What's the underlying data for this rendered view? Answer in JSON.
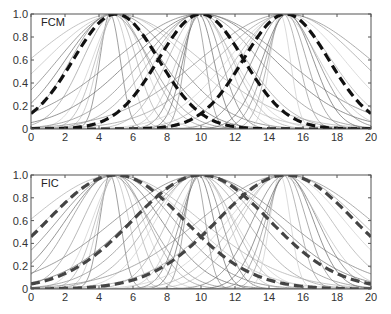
{
  "chart_data": [
    {
      "type": "line",
      "title": "FCM",
      "xlabel": "",
      "ylabel": "",
      "xlim": [
        0,
        20
      ],
      "ylim": [
        0,
        1.0
      ],
      "xticks": [
        0,
        2,
        4,
        6,
        8,
        10,
        12,
        14,
        16,
        18,
        20
      ],
      "yticks": [
        0,
        0.2,
        0.4,
        0.6,
        0.8,
        1.0
      ],
      "ytick_labels": [
        "0",
        "0.2",
        "0.4",
        "0.6",
        "0.8",
        "1.0"
      ],
      "grid": false,
      "legend": null,
      "annotation": "FCM",
      "series": [
        {
          "name": "cluster 1 (dashed)",
          "style": "dashed",
          "center": 5,
          "sigma": 2.5
        },
        {
          "name": "cluster 2 (dashed)",
          "style": "dashed",
          "center": 10,
          "sigma": 2.5
        },
        {
          "name": "cluster 3 (dashed)",
          "style": "dashed",
          "center": 15,
          "sigma": 2.5
        }
      ],
      "background_curves": {
        "description": "many thin gray Gaussian membership curves centered near 5, 10, 15 with varying widths",
        "centers": [
          5,
          10,
          15
        ],
        "sigmas": [
          0.6,
          0.9,
          1.2,
          1.5,
          1.9,
          2.3,
          2.8,
          3.4,
          4.2,
          5.0
        ]
      }
    },
    {
      "type": "line",
      "title": "FIC",
      "xlabel": "",
      "ylabel": "",
      "xlim": [
        0,
        20
      ],
      "ylim": [
        0,
        1.0
      ],
      "xticks": [
        0,
        2,
        4,
        6,
        8,
        10,
        12,
        14,
        16,
        18,
        20
      ],
      "yticks": [
        0,
        0.2,
        0.4,
        0.6,
        0.8,
        1.0
      ],
      "ytick_labels": [
        "0",
        "0.2",
        "0.4",
        "0.6",
        "0.8",
        "1.0"
      ],
      "grid": false,
      "legend": null,
      "annotation": "FIC",
      "series": [
        {
          "name": "cluster 1 (dashed)",
          "style": "dashed",
          "center": 5,
          "sigma": 4.0
        },
        {
          "name": "cluster 2 (dashed)",
          "style": "dashed",
          "center": 10,
          "sigma": 4.0
        },
        {
          "name": "cluster 3 (dashed)",
          "style": "dashed",
          "center": 15,
          "sigma": 4.0
        }
      ],
      "background_curves": {
        "description": "many thin gray Gaussian membership curves centered near 5, 10, 15 with varying widths",
        "centers": [
          5,
          10,
          15
        ],
        "sigmas": [
          0.6,
          0.9,
          1.2,
          1.5,
          1.9,
          2.3,
          2.8,
          3.4,
          4.2,
          5.0
        ]
      }
    }
  ],
  "colors": {
    "top_dashed": "#111111",
    "bottom_dashed": "#444444",
    "thin_curves": "#888888",
    "axes": "#555555"
  }
}
